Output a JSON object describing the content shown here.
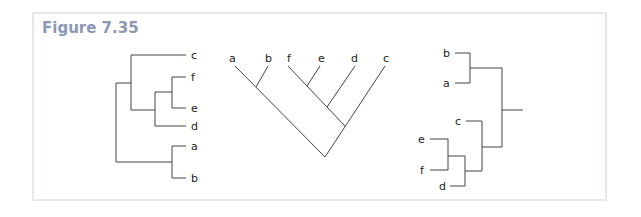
{
  "figure": {
    "title": "Figure 7.35",
    "accent_color": "#8d97b4",
    "trees": [
      {
        "name": "tree-1-rectangular-left-root",
        "labels": [
          "c",
          "f",
          "e",
          "d",
          "a",
          "b"
        ]
      },
      {
        "name": "tree-2-diagonal-cladogram",
        "labels": [
          "a",
          "b",
          "f",
          "e",
          "d",
          "c"
        ]
      },
      {
        "name": "tree-3-rectangular-right-root",
        "labels": [
          "b",
          "a",
          "c",
          "e",
          "f",
          "d"
        ]
      }
    ]
  }
}
